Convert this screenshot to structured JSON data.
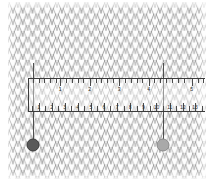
{
  "image": {
    "title": "Knitted fabric swatch with measuring ruler overlay",
    "background_color": "#ffffff",
    "fabric_color": "#8c8c8c",
    "fabric_fill": "#fdfdfd"
  },
  "fabric": {
    "name": "knit-stockinette-texture",
    "stitch_columns": 26,
    "stitch_rows": 17,
    "yarn_stroke_color": "#8a8a8a"
  },
  "ruler": {
    "frame_color": "#3c3c3c",
    "overlay_fill": "rgba(255,255,255,0.42)",
    "top_scale": {
      "unit_name": "cm",
      "labels": [
        "1",
        "2",
        "3",
        "4",
        "5"
      ],
      "major_positions_pct": [
        17.8,
        34.5,
        51.2,
        68.0,
        92.5
      ],
      "minor_count": 28
    },
    "bottom_scale": {
      "unit_name": "stitches",
      "labels": [
        "1",
        "2",
        "3",
        "4",
        "5",
        "6",
        "7",
        "8",
        "9",
        "10",
        "11",
        "12",
        "13"
      ],
      "major_positions_pct": [
        5.6,
        12.8,
        20.3,
        27.6,
        35.2,
        42.6,
        50.1,
        57.5,
        65.0,
        72.4,
        80.0,
        87.4,
        94.3
      ],
      "minor_count": 26
    }
  },
  "markers": [
    {
      "name": "marker-left",
      "label": "",
      "color": "#5a5a5a",
      "x_px": 33,
      "y_px": 145,
      "plumb_top_px": 63
    },
    {
      "name": "marker-right",
      "label": "",
      "color": "#a9a9a9",
      "x_px": 163,
      "y_px": 145,
      "plumb_top_px": 63
    }
  ]
}
